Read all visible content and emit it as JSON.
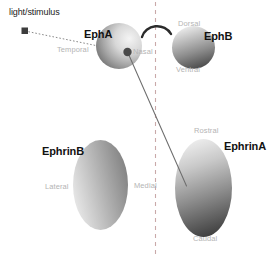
{
  "figure": {
    "background_color": "#ffffff"
  },
  "colors": {
    "major_label": "#121212",
    "axis_label": "#b4b4b4",
    "caption_label": "#1a1a1a",
    "midline_dashed": "#c9a9a9",
    "projection_line": "#6e6e6e",
    "stimulus_line": "#8a8a8a",
    "arc": "#2b2b2b",
    "gradient_light": "#f2f2f2",
    "gradient_dark": "#3a3a3a",
    "marker_fill": "#3d3d3d"
  },
  "stimulus": {
    "caption": "light/stimulus",
    "marker_name": "stimulus-square-marker"
  },
  "eyes": {
    "left_eye": {
      "receptor_label": "EphA",
      "axis_start_label": "Temporal",
      "axis_end_label": "Nasal",
      "gradient_direction": "dark-temporal-to-light-nasal"
    },
    "right_eye": {
      "receptor_label": "EphB",
      "axis_start_label": "Dorsal",
      "axis_end_label": "Ventral",
      "gradient_direction": "light-dorsal-to-dark-ventral"
    }
  },
  "targets": {
    "left_target": {
      "ligand_label": "EphrinB",
      "axis_start_label": "Lateral",
      "axis_end_label": "Medial",
      "gradient_direction": "light-lateral-to-dark-medial"
    },
    "right_target": {
      "ligand_label": "EphrinA",
      "axis_start_label": "Rostral",
      "axis_end_label": "Caudal",
      "gradient_direction": "light-rostral-to-dark-caudal"
    }
  },
  "connectors": {
    "stimulus_ray_name": "stimulus-ray-dotted-line",
    "projection_axon_name": "retinotectal-projection-line",
    "midline_name": "body-midline-dashed-line",
    "arc_name": "brain-arc"
  }
}
